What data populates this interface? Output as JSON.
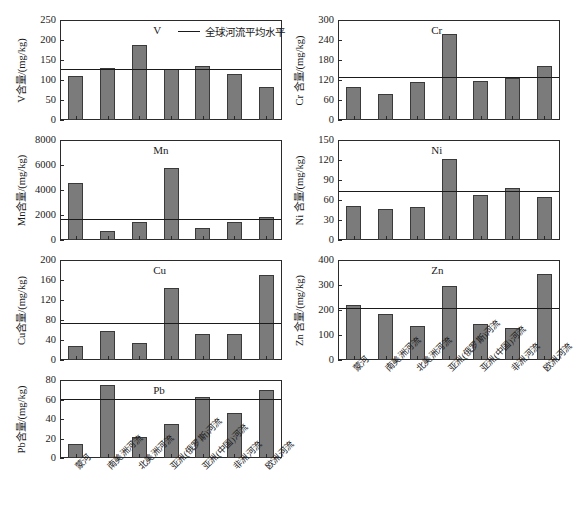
{
  "chart_data": {
    "type": "bar",
    "title": "",
    "layout": {
      "rows": 4,
      "cols": 2,
      "grid": false,
      "legend_position": "top-center-of-first-panel",
      "shared_categories": true
    },
    "categories": [
      "蒙河",
      "南美洲河流",
      "北美洲河流",
      "亚洲(俄罗斯)河流",
      "亚洲(中国)河流",
      "非洲河流",
      "欧洲河流"
    ],
    "legend": [
      {
        "label": "全球河流平均水平",
        "marker": "line",
        "color": "#1a1a1a"
      }
    ],
    "series_color": "#7b7b7b",
    "panels": [
      {
        "id": "V",
        "element": "V",
        "ylabel": "V含量/(mg/kg)",
        "ylim": [
          0,
          250
        ],
        "yticks": [
          0,
          50,
          100,
          150,
          200,
          250
        ],
        "values": [
          109,
          130,
          188,
          128,
          134,
          115,
          83
        ],
        "reference_line": 127,
        "reference_line_label": "全球河流平均水平"
      },
      {
        "id": "Cr",
        "element": "Cr",
        "ylabel": "Cr 含量/(mg/kg)",
        "ylim": [
          0,
          300
        ],
        "yticks": [
          0,
          60,
          120,
          180,
          240,
          300
        ],
        "values": [
          100,
          77,
          114,
          257,
          116,
          126,
          163
        ],
        "reference_line": 128,
        "reference_line_label": "全球河流平均水平"
      },
      {
        "id": "Mn",
        "element": "Mn",
        "ylabel": "Mn含量/(mg/kg)",
        "ylim": [
          0,
          8000
        ],
        "yticks": [
          0,
          2000,
          4000,
          6000,
          8000
        ],
        "values": [
          4600,
          720,
          1450,
          5750,
          960,
          1460,
          1860
        ],
        "reference_line": 1670,
        "reference_line_label": "全球河流平均水平"
      },
      {
        "id": "Ni",
        "element": "Ni",
        "ylabel": "Ni 含量/(mg/kg)",
        "ylim": [
          0,
          150
        ],
        "yticks": [
          0,
          30,
          60,
          90,
          120,
          150
        ],
        "values": [
          51,
          46,
          50,
          122,
          67,
          78,
          65
        ],
        "reference_line": 74,
        "reference_line_label": "全球河流平均水平"
      },
      {
        "id": "Cu",
        "element": "Cu",
        "ylabel": "Cu含量/(mg/kg)",
        "ylim": [
          0,
          200
        ],
        "yticks": [
          0,
          40,
          80,
          120,
          160,
          200
        ],
        "values": [
          28,
          58,
          35,
          145,
          53,
          53,
          170
        ],
        "reference_line": 75,
        "reference_line_label": "全球河流平均水平"
      },
      {
        "id": "Zn",
        "element": "Zn",
        "ylabel": "Zn 含量/(mg/kg)",
        "ylim": [
          0,
          400
        ],
        "yticks": [
          0,
          100,
          200,
          300,
          400
        ],
        "values": [
          222,
          186,
          138,
          298,
          144,
          130,
          345
        ],
        "reference_line": 207,
        "reference_line_label": "全球河流平均水平"
      },
      {
        "id": "Pb",
        "element": "Pb",
        "ylabel": "Pb含量/(mg/kg)",
        "ylim": [
          0,
          80
        ],
        "yticks": [
          0,
          20,
          40,
          60,
          80
        ],
        "values": [
          14,
          75,
          22,
          35,
          63,
          46,
          70
        ],
        "reference_line": 61,
        "reference_line_label": "全球河流平均水平"
      }
    ]
  }
}
